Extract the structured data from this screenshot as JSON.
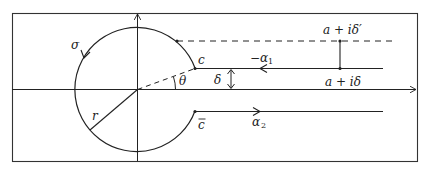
{
  "diagram": {
    "type": "contour-integration",
    "labels": {
      "sigma": "σ",
      "c": "c",
      "c_bar": "c",
      "theta": "θ",
      "delta": "δ",
      "r": "r",
      "minus_alpha": "−α",
      "minus_alpha_sub": "1",
      "alpha": "α",
      "alpha_sub": "2",
      "a_plus_i_delta_prime": "a + iδ′",
      "a_plus_i_delta": "a + iδ"
    },
    "colors": {
      "stroke": "#222222",
      "background": "#ffffff"
    }
  }
}
